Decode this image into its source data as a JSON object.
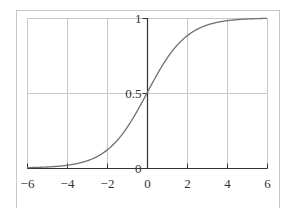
{
  "chart_data": {
    "type": "line",
    "title": "",
    "xlabel": "",
    "ylabel": "",
    "function": "logistic sigmoid 1/(1+e^(-x))",
    "xlim": [
      -6,
      6
    ],
    "ylim": [
      0,
      1
    ],
    "grid": true,
    "legend": null,
    "x_ticks": [
      -6,
      -4,
      -2,
      0,
      2,
      4,
      6
    ],
    "x_tick_labels": [
      "−6",
      "−4",
      "−2",
      "0",
      "2",
      "4",
      "6"
    ],
    "y_ticks": [
      0,
      0.5,
      1
    ],
    "y_tick_labels": [
      "0",
      "0.5",
      "1"
    ],
    "series": [
      {
        "name": "sigmoid",
        "color": "#707070",
        "x": [
          -6,
          -5,
          -4,
          -3,
          -2,
          -1.5,
          -1,
          -0.5,
          0,
          0.5,
          1,
          1.5,
          2,
          3,
          4,
          5,
          6
        ],
        "y": [
          0.0025,
          0.0067,
          0.018,
          0.047,
          0.119,
          0.182,
          0.269,
          0.378,
          0.5,
          0.622,
          0.731,
          0.818,
          0.881,
          0.953,
          0.982,
          0.9933,
          0.9975
        ]
      }
    ]
  },
  "colors": {
    "frame": "#c8c8c8",
    "grid": "#c8c8c8",
    "axis": "#333333",
    "curve": "#707070"
  }
}
